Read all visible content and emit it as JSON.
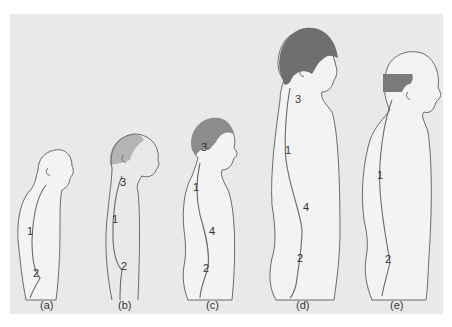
{
  "figure": {
    "background_color": "#e9e9e9",
    "body_fill": "#f3f3f3",
    "hair_color": "#8a8a8a",
    "panels": [
      {
        "id": "a",
        "caption": "(a)",
        "labels": {
          "1": "1",
          "2": "2"
        }
      },
      {
        "id": "b",
        "caption": "(b)",
        "labels": {
          "3": "3",
          "1": "1",
          "2": "2"
        }
      },
      {
        "id": "c",
        "caption": "(c)",
        "labels": {
          "3": "3",
          "1": "1",
          "4": "4",
          "2": "2"
        }
      },
      {
        "id": "d",
        "caption": "(d)",
        "labels": {
          "3": "3",
          "1": "1",
          "4": "4",
          "2": "2"
        }
      },
      {
        "id": "e",
        "caption": "(e)",
        "labels": {
          "1": "1",
          "2": "2"
        }
      }
    ]
  }
}
